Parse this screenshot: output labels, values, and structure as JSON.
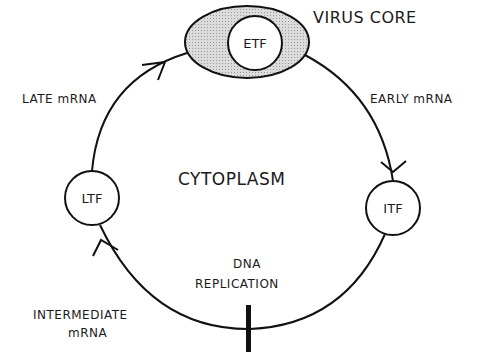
{
  "diagram": {
    "colors": {
      "stroke": "#111111",
      "core_fill": "#d0d0d0",
      "background": "#ffffff"
    },
    "compartments": {
      "virus_core": "VIRUS CORE",
      "cytoplasm": "CYTOPLASM"
    },
    "nodes": {
      "etf": "ETF",
      "itf": "ITF",
      "ltf": "LTF"
    },
    "edges": {
      "early": "EARLY mRNA",
      "intermediate_line1": "INTERMEDIATE",
      "intermediate_line2": "mRNA",
      "late": "LATE mRNA"
    },
    "events": {
      "dna_replication_line1": "DNA",
      "dna_replication_line2": "REPLICATION"
    }
  }
}
